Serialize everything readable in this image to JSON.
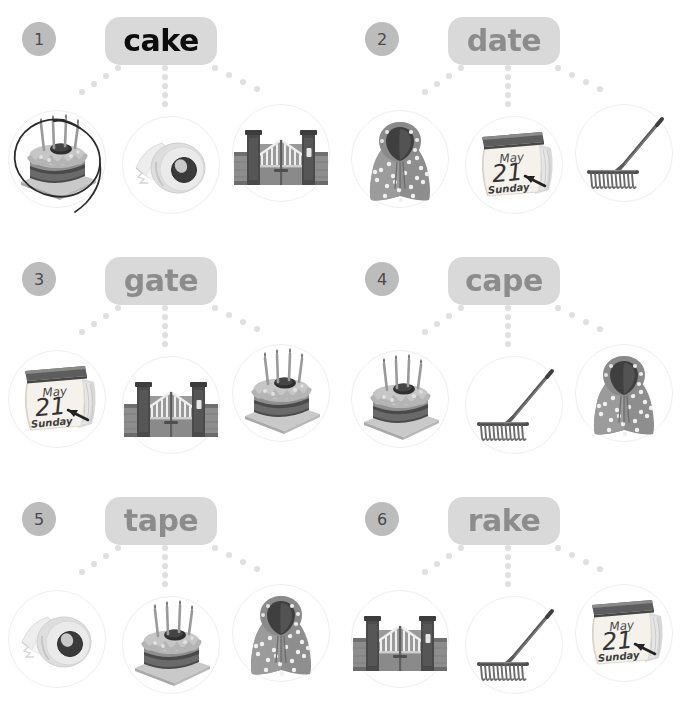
{
  "worksheet": {
    "title": "Word and Picture Matching Worksheet",
    "columns": 2,
    "rows": 3,
    "background_color": "#ffffff",
    "pill_color": "#d9d9d9",
    "badge_color": "#bcbcbc",
    "word_color_unanswered": "#8c8c8c",
    "word_color_answered": "#0d0d0d",
    "dot_color": "#e0e0e0",
    "circle_border_color": "#efefef",
    "marker_color": "#2b2b2b"
  },
  "exercises": [
    {
      "number": "1",
      "word": "cake",
      "answered": true,
      "pictures": [
        {
          "name": "cake",
          "label": "birthday cake",
          "marked": true
        },
        {
          "name": "tape",
          "label": "tape roll",
          "marked": false
        },
        {
          "name": "gate",
          "label": "gate",
          "marked": false
        }
      ]
    },
    {
      "number": "2",
      "word": "date",
      "answered": false,
      "pictures": [
        {
          "name": "cape",
          "label": "polka dot cape",
          "marked": false
        },
        {
          "name": "calendar",
          "label": "calendar May 21 Sunday",
          "marked": false
        },
        {
          "name": "rake",
          "label": "garden rake",
          "marked": false
        }
      ]
    },
    {
      "number": "3",
      "word": "gate",
      "answered": false,
      "pictures": [
        {
          "name": "calendar",
          "label": "calendar May 21 Sunday",
          "marked": false
        },
        {
          "name": "gate",
          "label": "gate",
          "marked": false
        },
        {
          "name": "cake",
          "label": "birthday cake",
          "marked": false
        }
      ]
    },
    {
      "number": "4",
      "word": "cape",
      "answered": false,
      "pictures": [
        {
          "name": "cake",
          "label": "birthday cake",
          "marked": false
        },
        {
          "name": "rake",
          "label": "garden rake",
          "marked": false
        },
        {
          "name": "cape",
          "label": "polka dot cape",
          "marked": false
        }
      ]
    },
    {
      "number": "5",
      "word": "tape",
      "answered": false,
      "pictures": [
        {
          "name": "tape",
          "label": "tape roll",
          "marked": false
        },
        {
          "name": "cake",
          "label": "birthday cake",
          "marked": false
        },
        {
          "name": "cape",
          "label": "polka dot cape",
          "marked": false
        }
      ]
    },
    {
      "number": "6",
      "word": "rake",
      "answered": false,
      "pictures": [
        {
          "name": "gate",
          "label": "gate",
          "marked": false
        },
        {
          "name": "rake",
          "label": "garden rake",
          "marked": false
        },
        {
          "name": "calendar",
          "label": "calendar May 21 Sunday",
          "marked": false
        }
      ]
    }
  ],
  "calendar_art": {
    "month": "May",
    "day": "21",
    "weekday": "Sunday"
  }
}
